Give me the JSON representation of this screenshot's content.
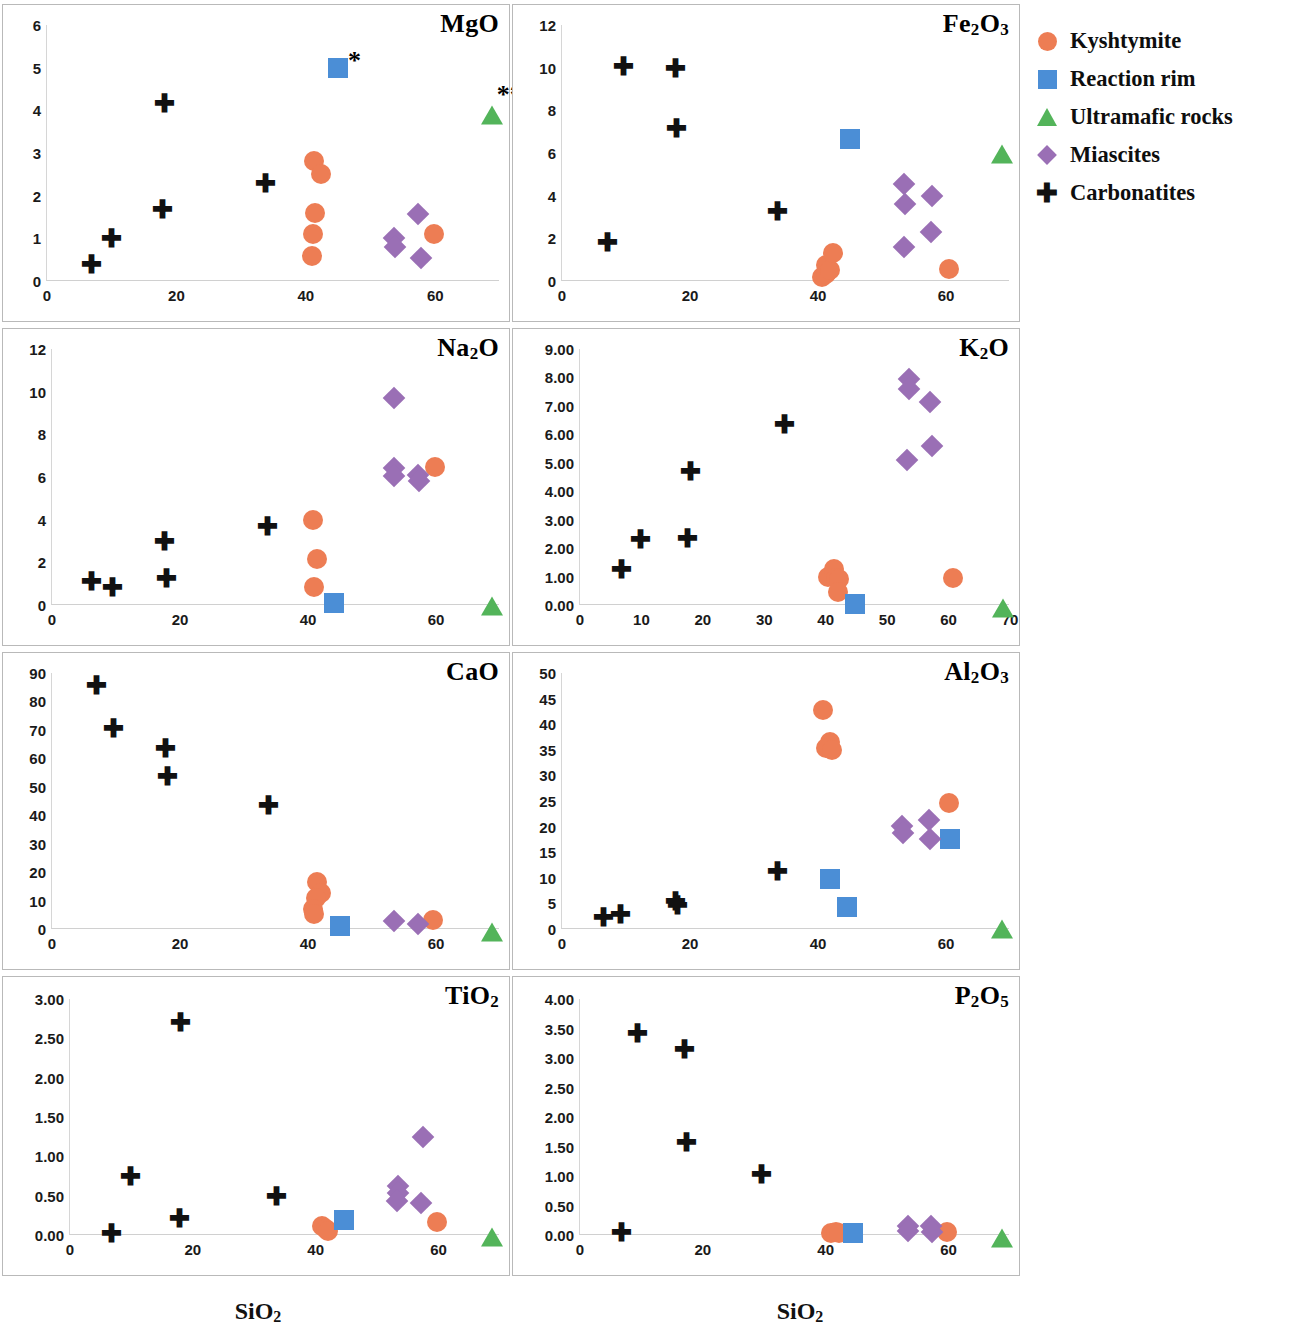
{
  "legend": {
    "items": [
      {
        "label": "Kyshtymite",
        "marker": "circle",
        "color": "#ED7D54"
      },
      {
        "label": "Reaction rim",
        "marker": "square",
        "color": "#4B8ED6"
      },
      {
        "label": "Ultramafic rocks",
        "marker": "triangle",
        "color": "#53B45A"
      },
      {
        "label": "Miascites",
        "marker": "diamond",
        "color": "#9A6FB5"
      },
      {
        "label": "Carbonatites",
        "marker": "plus",
        "color": "#111111"
      }
    ]
  },
  "axis_titles": {
    "x_left": "SiO2",
    "x_right": "SiO2"
  },
  "chart_data": [
    {
      "type": "scatter",
      "title": "MgO",
      "xlabel": "SiO2",
      "ylabel": "MgO",
      "xlim": [
        0,
        70
      ],
      "ylim": [
        0,
        6
      ],
      "xticks": [
        0,
        20,
        40,
        60
      ],
      "yticks": [
        0,
        1,
        2,
        3,
        4,
        5,
        6
      ],
      "grid": false,
      "annotations": [
        {
          "text": "*",
          "x": 47.5,
          "y": 5.15
        },
        {
          "text": "**",
          "x": 71.5,
          "y": 4.35
        }
      ],
      "series": [
        {
          "name": "Kyshtymite",
          "marker": "circle",
          "points": [
            [
              41.3,
              2.82
            ],
            [
              42.4,
              2.5
            ],
            [
              41.4,
              1.6
            ],
            [
              41.1,
              1.1
            ],
            [
              41.0,
              0.58
            ],
            [
              59.8,
              1.1
            ]
          ]
        },
        {
          "name": "Reaction rim",
          "marker": "square",
          "points": [
            [
              45.0,
              5.0
            ]
          ]
        },
        {
          "name": "Ultramafic rocks",
          "marker": "triangle",
          "points": [
            [
              68.7,
              3.98
            ]
          ]
        },
        {
          "name": "Miascites",
          "marker": "diamond",
          "points": [
            [
              53.6,
              1.0
            ],
            [
              53.8,
              0.8
            ],
            [
              57.4,
              1.58
            ],
            [
              57.8,
              0.55
            ]
          ]
        },
        {
          "name": "Carbonatites",
          "marker": "plus",
          "points": [
            [
              6.9,
              0.38
            ],
            [
              9.9,
              1.0
            ],
            [
              17.8,
              1.68
            ],
            [
              18.2,
              4.15
            ],
            [
              33.8,
              2.28
            ]
          ]
        }
      ]
    },
    {
      "type": "scatter",
      "title": "Fe2O3",
      "xlabel": "SiO2",
      "ylabel": "Fe2O3",
      "xlim": [
        0,
        70
      ],
      "ylim": [
        0,
        12
      ],
      "xticks": [
        0,
        20,
        40,
        60
      ],
      "yticks": [
        0,
        2,
        4,
        6,
        8,
        10,
        12
      ],
      "grid": false,
      "annotations": [],
      "series": [
        {
          "name": "Kyshtymite",
          "marker": "circle",
          "points": [
            [
              40.7,
              0.2
            ],
            [
              41.2,
              0.35
            ],
            [
              41.3,
              0.75
            ],
            [
              41.8,
              0.5
            ],
            [
              42.4,
              1.3
            ],
            [
              60.4,
              0.55
            ]
          ]
        },
        {
          "name": "Reaction rim",
          "marker": "square",
          "points": [
            [
              45.0,
              6.65
            ]
          ]
        },
        {
          "name": "Ultramafic rocks",
          "marker": "triangle",
          "points": [
            [
              68.7,
              6.15
            ]
          ]
        },
        {
          "name": "Miascites",
          "marker": "diamond",
          "points": [
            [
              53.5,
              4.55
            ],
            [
              53.6,
              3.6
            ],
            [
              53.5,
              1.6
            ],
            [
              57.8,
              4.0
            ],
            [
              57.6,
              2.3
            ]
          ]
        },
        {
          "name": "Carbonatites",
          "marker": "plus",
          "points": [
            [
              7.1,
              1.8
            ],
            [
              9.6,
              10.05
            ],
            [
              17.8,
              9.95
            ],
            [
              17.9,
              7.15
            ],
            [
              33.6,
              3.25
            ]
          ]
        }
      ]
    },
    {
      "type": "scatter",
      "title": "Na2O",
      "xlabel": "SiO2",
      "ylabel": "Na2O",
      "xlim": [
        0,
        70
      ],
      "ylim": [
        0,
        12
      ],
      "xticks": [
        0,
        20,
        40,
        60
      ],
      "yticks": [
        0,
        2,
        4,
        6,
        8,
        10,
        12
      ],
      "grid": false,
      "annotations": [],
      "series": [
        {
          "name": "Kyshtymite",
          "marker": "circle",
          "points": [
            [
              40.8,
              3.98
            ],
            [
              41.4,
              2.15
            ],
            [
              41.0,
              0.85
            ],
            [
              59.8,
              6.45
            ]
          ]
        },
        {
          "name": "Reaction rim",
          "marker": "square",
          "points": [
            [
              44.0,
              0.1
            ]
          ]
        },
        {
          "name": "Ultramafic rocks",
          "marker": "triangle",
          "points": [
            [
              68.7,
              0.15
            ]
          ]
        },
        {
          "name": "Miascites",
          "marker": "diamond",
          "points": [
            [
              53.5,
              9.7
            ],
            [
              53.4,
              6.4
            ],
            [
              53.5,
              6.05
            ],
            [
              57.2,
              6.1
            ],
            [
              57.4,
              5.8
            ]
          ]
        },
        {
          "name": "Carbonatites",
          "marker": "plus",
          "points": [
            [
              6.2,
              1.1
            ],
            [
              9.5,
              0.82
            ],
            [
              17.5,
              3.0
            ],
            [
              17.9,
              1.25
            ],
            [
              33.7,
              3.7
            ]
          ]
        }
      ]
    },
    {
      "type": "scatter",
      "title": "K2O",
      "xlabel": "SiO2",
      "ylabel": "K2O",
      "xlim": [
        0,
        70
      ],
      "ylim": [
        0,
        9
      ],
      "xticks": [
        0,
        10,
        20,
        30,
        40,
        50,
        60,
        70
      ],
      "yticks": [
        "0.00",
        "1.00",
        "2.00",
        "3.00",
        "4.00",
        "5.00",
        "6.00",
        "7.00",
        "8.00",
        "9.00"
      ],
      "grid": false,
      "annotations": [],
      "series": [
        {
          "name": "Kyshtymite",
          "marker": "circle",
          "points": [
            [
              40.3,
              1.0
            ],
            [
              41.3,
              1.25
            ],
            [
              41.6,
              0.95
            ],
            [
              42.2,
              0.92
            ],
            [
              42.0,
              0.45
            ],
            [
              60.7,
              0.95
            ]
          ]
        },
        {
          "name": "Reaction rim",
          "marker": "square",
          "points": [
            [
              44.8,
              0.05
            ]
          ]
        },
        {
          "name": "Ultramafic rocks",
          "marker": "triangle",
          "points": [
            [
              68.9,
              0.05
            ]
          ]
        },
        {
          "name": "Miascites",
          "marker": "diamond",
          "points": [
            [
              53.5,
              7.95
            ],
            [
              53.6,
              7.6
            ],
            [
              53.3,
              5.1
            ],
            [
              57.0,
              7.15
            ],
            [
              57.3,
              5.6
            ]
          ]
        },
        {
          "name": "Carbonatites",
          "marker": "plus",
          "points": [
            [
              6.8,
              1.25
            ],
            [
              9.8,
              2.3
            ],
            [
              17.5,
              2.35
            ],
            [
              18.0,
              4.7
            ],
            [
              33.3,
              6.35
            ]
          ]
        }
      ]
    },
    {
      "type": "scatter",
      "title": "CaO",
      "xlabel": "SiO2",
      "ylabel": "CaO",
      "xlim": [
        0,
        70
      ],
      "ylim": [
        0,
        90
      ],
      "xticks": [
        0,
        20,
        40,
        60
      ],
      "yticks": [
        0,
        10,
        20,
        30,
        40,
        50,
        60,
        70,
        80,
        90
      ],
      "grid": false,
      "annotations": [],
      "series": [
        {
          "name": "Kyshtymite",
          "marker": "circle",
          "points": [
            [
              41.4,
              16.5
            ],
            [
              42.0,
              12.5
            ],
            [
              41.2,
              11.0
            ],
            [
              40.8,
              7.0
            ],
            [
              41.0,
              5.2
            ],
            [
              59.5,
              3.3
            ]
          ]
        },
        {
          "name": "Reaction rim",
          "marker": "square",
          "points": [
            [
              45.0,
              1.0
            ]
          ]
        },
        {
          "name": "Ultramafic rocks",
          "marker": "triangle",
          "points": [
            [
              68.7,
              0.3
            ]
          ]
        },
        {
          "name": "Miascites",
          "marker": "diamond",
          "points": [
            [
              53.4,
              2.8
            ],
            [
              57.2,
              1.8
            ]
          ]
        },
        {
          "name": "Carbonatites",
          "marker": "plus",
          "points": [
            [
              6.9,
              85.5
            ],
            [
              9.6,
              70.5
            ],
            [
              17.8,
              63.5
            ],
            [
              18.0,
              53.5
            ],
            [
              33.8,
              43.5
            ]
          ]
        }
      ]
    },
    {
      "type": "scatter",
      "title": "Al2O3",
      "xlabel": "SiO2",
      "ylabel": "Al2O3",
      "xlim": [
        0,
        70
      ],
      "ylim": [
        0,
        50
      ],
      "xticks": [
        0,
        20,
        40,
        60
      ],
      "yticks": [
        0,
        5,
        10,
        15,
        20,
        25,
        30,
        35,
        40,
        45,
        50
      ],
      "grid": false,
      "annotations": [],
      "series": [
        {
          "name": "Kyshtymite",
          "marker": "circle",
          "points": [
            [
              40.8,
              42.8
            ],
            [
              41.8,
              36.5
            ],
            [
              41.2,
              35.3
            ],
            [
              42.2,
              35.0
            ],
            [
              60.4,
              24.6
            ]
          ]
        },
        {
          "name": "Reaction rim",
          "marker": "square",
          "points": [
            [
              41.8,
              9.8
            ],
            [
              44.6,
              4.3
            ],
            [
              60.6,
              17.6
            ]
          ]
        },
        {
          "name": "Ultramafic rocks",
          "marker": "triangle",
          "points": [
            [
              68.7,
              0.8
            ]
          ]
        },
        {
          "name": "Miascites",
          "marker": "diamond",
          "points": [
            [
              53.2,
              20.2
            ],
            [
              53.3,
              18.8
            ],
            [
              57.3,
              21.3
            ],
            [
              57.5,
              17.6
            ]
          ]
        },
        {
          "name": "Carbonatites",
          "marker": "plus",
          "points": [
            [
              6.5,
              2.3
            ],
            [
              9.2,
              2.8
            ],
            [
              17.8,
              5.4
            ],
            [
              18.0,
              4.6
            ],
            [
              33.6,
              11.2
            ]
          ]
        }
      ]
    },
    {
      "type": "scatter",
      "title": "TiO2",
      "xlabel": "SiO2",
      "ylabel": "TiO2",
      "xlim": [
        0,
        70
      ],
      "ylim": [
        0,
        3
      ],
      "xticks": [
        0,
        20,
        40,
        60
      ],
      "yticks": [
        "0.00",
        "0.50",
        "1.00",
        "1.50",
        "2.00",
        "2.50",
        "3.00"
      ],
      "grid": false,
      "annotations": [],
      "series": [
        {
          "name": "Kyshtymite",
          "marker": "circle",
          "points": [
            [
              41.0,
              0.12
            ],
            [
              41.6,
              0.07
            ],
            [
              42.0,
              0.05
            ],
            [
              59.8,
              0.16
            ]
          ]
        },
        {
          "name": "Reaction rim",
          "marker": "square",
          "points": [
            [
              44.6,
              0.19
            ]
          ]
        },
        {
          "name": "Ultramafic rocks",
          "marker": "triangle",
          "points": [
            [
              68.7,
              0.02
            ]
          ]
        },
        {
          "name": "Miascites",
          "marker": "diamond",
          "points": [
            [
              53.4,
              0.62
            ],
            [
              53.4,
              0.53
            ],
            [
              53.3,
              0.43
            ],
            [
              57.4,
              1.24
            ],
            [
              57.2,
              0.41
            ]
          ]
        },
        {
          "name": "Carbonatites",
          "marker": "plus",
          "points": [
            [
              6.8,
              0.02
            ],
            [
              9.8,
              0.75
            ],
            [
              17.8,
              0.21
            ],
            [
              18.0,
              2.7
            ],
            [
              33.6,
              0.49
            ]
          ]
        }
      ]
    },
    {
      "type": "scatter",
      "title": "P2O5",
      "xlabel": "SiO2",
      "ylabel": "P2O5",
      "xlim": [
        0,
        70
      ],
      "ylim": [
        0,
        4
      ],
      "xticks": [
        0,
        20,
        40,
        60
      ],
      "yticks": [
        "0.00",
        "0.50",
        "1.00",
        "1.50",
        "2.00",
        "2.50",
        "3.00",
        "3.50",
        "4.00"
      ],
      "grid": false,
      "annotations": [],
      "series": [
        {
          "name": "Kyshtymite",
          "marker": "circle",
          "points": [
            [
              40.8,
              0.04
            ],
            [
              41.6,
              0.05
            ],
            [
              42.2,
              0.04
            ],
            [
              59.8,
              0.05
            ]
          ]
        },
        {
          "name": "Reaction rim",
          "marker": "square",
          "points": [
            [
              44.4,
              0.04
            ]
          ]
        },
        {
          "name": "Ultramafic rocks",
          "marker": "triangle",
          "points": [
            [
              68.7,
              0.02
            ]
          ]
        },
        {
          "name": "Miascites",
          "marker": "diamond",
          "points": [
            [
              53.4,
              0.15
            ],
            [
              53.4,
              0.06
            ],
            [
              57.2,
              0.16
            ],
            [
              57.3,
              0.05
            ]
          ]
        },
        {
          "name": "Carbonatites",
          "marker": "plus",
          "points": [
            [
              6.8,
              0.04
            ],
            [
              9.4,
              3.42
            ],
            [
              17.0,
              3.15
            ],
            [
              17.4,
              1.57
            ],
            [
              29.6,
              1.02
            ]
          ]
        }
      ]
    }
  ]
}
